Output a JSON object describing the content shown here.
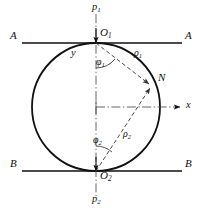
{
  "figure": {
    "type": "geometry-diagram",
    "colors": {
      "stroke": "#111111",
      "background": "#ffffff",
      "dash": "#444444"
    },
    "circle": {
      "cx": 96,
      "cy": 107,
      "r": 64
    },
    "labels": {
      "p1": {
        "text": "p",
        "sub": "1",
        "x": 92,
        "y": 6
      },
      "p2": {
        "text": "p",
        "sub": "2",
        "x": 92,
        "y": 198
      },
      "O1": {
        "text": "O",
        "sub": "1",
        "x": 101,
        "y": 33
      },
      "O2": {
        "text": "O",
        "sub": "2",
        "x": 101,
        "y": 173
      },
      "A_left": {
        "text": "A",
        "x": 12,
        "y": 35
      },
      "A_right": {
        "text": "A",
        "x": 186,
        "y": 35
      },
      "B_left": {
        "text": "B",
        "x": 12,
        "y": 166
      },
      "B_right": {
        "text": "B",
        "x": 186,
        "y": 166
      },
      "x_axis": {
        "text": "x",
        "x": 188,
        "y": 101
      },
      "y_axis": {
        "text": "y",
        "x": 73,
        "y": 53
      },
      "N": {
        "text": "N",
        "x": 160,
        "y": 78
      },
      "rho1": {
        "text": "ρ",
        "sub": "1",
        "x": 137,
        "y": 54
      },
      "rho2": {
        "text": "ρ",
        "sub": "2",
        "x": 126,
        "y": 135
      },
      "phi1": {
        "text": "φ",
        "sub": "1",
        "x": 98,
        "y": 62
      },
      "phi2": {
        "text": "φ",
        "sub": "2",
        "x": 95,
        "y": 141
      }
    }
  }
}
